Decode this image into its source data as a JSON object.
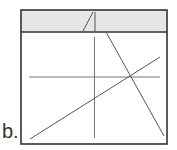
{
  "figure": {
    "label": "b.",
    "frame": {
      "x": 21,
      "y": 10,
      "width": 146,
      "height": 134,
      "stroke": "#333333"
    },
    "band": {
      "height": 22,
      "fill": "#e6e6e6"
    },
    "band_glyph": "/|",
    "colors": {
      "line": "#555555",
      "frame": "#333333",
      "band": "#e6e6e6"
    }
  }
}
